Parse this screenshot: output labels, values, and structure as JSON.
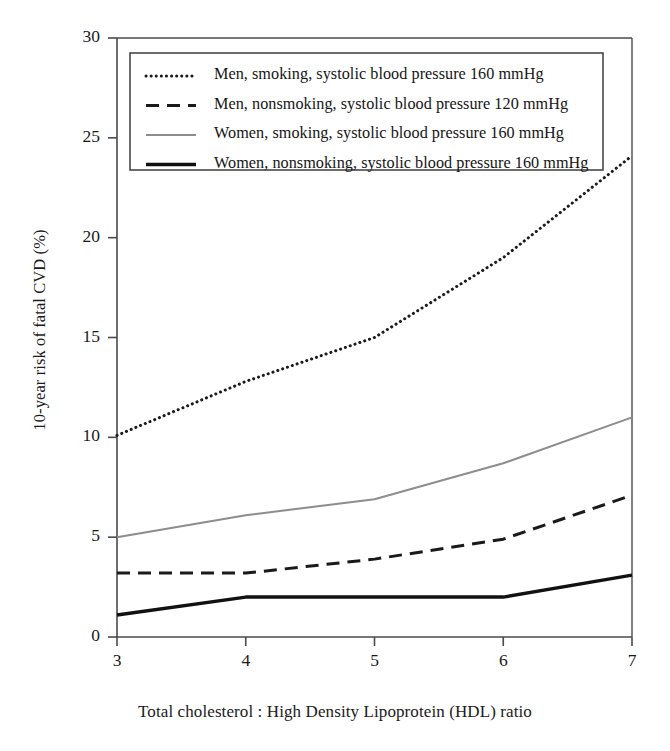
{
  "chart_data": {
    "type": "line",
    "title": "",
    "xlabel": "Total cholesterol : High Density Lipoprotein (HDL) ratio",
    "ylabel": "10-year risk of fatal CVD (%)",
    "x": [
      3,
      4,
      5,
      6,
      7
    ],
    "xlim": [
      3,
      7
    ],
    "ylim": [
      0,
      30
    ],
    "xticks": [
      "3",
      "4",
      "5",
      "6",
      "7"
    ],
    "yticks": [
      "0",
      "5",
      "10",
      "15",
      "20",
      "25",
      "30"
    ],
    "grid": false,
    "legend_position": "upper-left-inside",
    "series": [
      {
        "name": "Men, smoking, systolic blood pressure 160 mmHg",
        "style": "dotted",
        "color": "#1a1a1a",
        "values": [
          10.1,
          12.8,
          15.0,
          19.0,
          24.1
        ]
      },
      {
        "name": "Men, nonsmoking, systolic blood pressure 120 mmHg",
        "style": "dashed",
        "color": "#1a1a1a",
        "values": [
          3.2,
          3.2,
          3.9,
          4.9,
          7.1
        ]
      },
      {
        "name": "Women, smoking, systolic blood pressure 160 mmHg",
        "style": "solid-thin-gray",
        "color": "#8d8d8d",
        "values": [
          5.0,
          6.1,
          6.9,
          8.7,
          11.0
        ]
      },
      {
        "name": "Women, nonsmoking, systolic blood pressure 160 mmHg",
        "style": "solid-thick",
        "color": "#111111",
        "values": [
          1.1,
          2.0,
          2.0,
          2.0,
          3.1
        ]
      }
    ]
  },
  "legend": {
    "items": [
      {
        "label": "Men, smoking, systolic blood pressure 160 mmHg"
      },
      {
        "label": "Men, nonsmoking, systolic blood pressure 120 mmHg"
      },
      {
        "label": "Women, smoking, systolic blood pressure 160 mmHg"
      },
      {
        "label": "Women, nonsmoking, systolic blood pressure 160 mmHg"
      }
    ]
  },
  "axes": {
    "y_title": "10-year risk of fatal CVD (%)",
    "x_title": "Total cholesterol : High Density Lipoprotein (HDL) ratio"
  },
  "colors": {
    "axis": "#4a4a4a",
    "ink": "#1a1a1a",
    "gray_series": "#8d8d8d"
  }
}
